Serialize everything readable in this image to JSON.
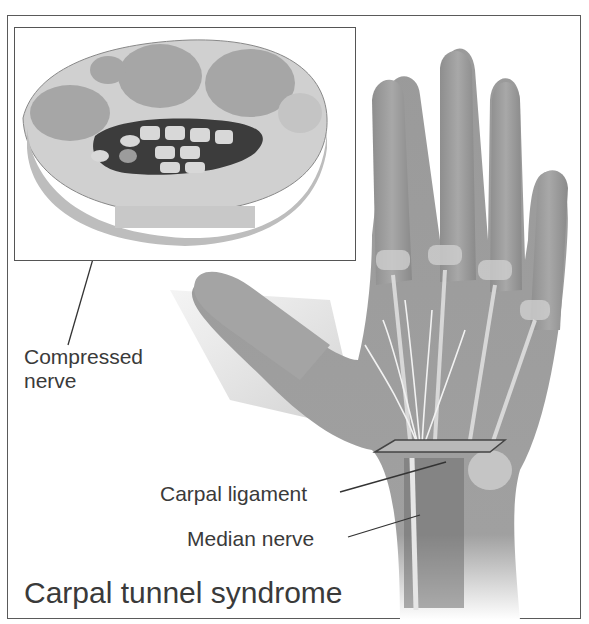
{
  "figure": {
    "title": "Carpal tunnel syndrome",
    "inset": {
      "description": "Cross-section of wrist showing carpal tunnel",
      "label": "Compressed\nnerve",
      "label_line1": "Compressed",
      "label_line2": "nerve"
    },
    "labels": {
      "carpal_ligament": "Carpal ligament",
      "median_nerve": "Median nerve"
    },
    "colors": {
      "frame": "#5a5a5a",
      "text": "#3a3a3a",
      "skin": "#9a9a9a",
      "bone": "#d8d8d8",
      "tunnel_dark": "#3c3c3c"
    }
  }
}
